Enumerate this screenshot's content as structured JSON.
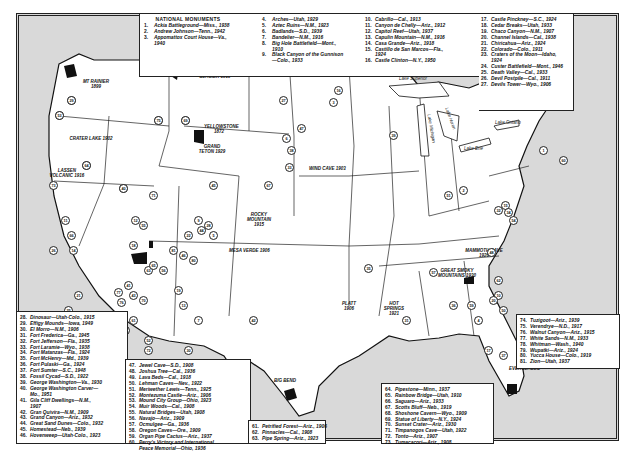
{
  "legend_top": {
    "title": "NATIONAL MONUMENTS",
    "col1": [
      {
        "n": "1.",
        "t": "Ackia Battleground—Miss., 1938"
      },
      {
        "n": "2.",
        "t": "Andrew Johnson—Tenn., 1942"
      },
      {
        "n": "3.",
        "t": "Appomattox Court House—Va.,"
      },
      {
        "n": "",
        "t": "1940"
      }
    ],
    "col2": [
      {
        "n": "4.",
        "t": "Arches—Utah, 1929"
      },
      {
        "n": "5.",
        "t": "Aztec Ruins—N.M., 1923"
      },
      {
        "n": "6.",
        "t": "Badlands—S.D., 1939"
      },
      {
        "n": "7.",
        "t": "Bandelier—N.M., 1916"
      },
      {
        "n": "8.",
        "t": "Big Hole Battlefield—Mont.,"
      },
      {
        "n": "",
        "t": "1910"
      },
      {
        "n": "9.",
        "t": "Black Canyon of the Gunnison"
      },
      {
        "n": "",
        "t": "—Colo., 1933"
      }
    ],
    "col3": [
      {
        "n": "10.",
        "t": "Cabrillo—Cal., 1913"
      },
      {
        "n": "11.",
        "t": "Canyon de Chelly—Ariz., 1912"
      },
      {
        "n": "12.",
        "t": "Capitol Reef—Utah, 1937"
      },
      {
        "n": "13.",
        "t": "Capulin Mountain—N.M., 1916"
      },
      {
        "n": "14.",
        "t": "Casa Grande—Ariz., 1918"
      },
      {
        "n": "15.",
        "t": "Castillo de San Marcos—Fla.,"
      },
      {
        "n": "",
        "t": "1924"
      },
      {
        "n": "16.",
        "t": "Castle Clinton—N.Y., 1950"
      }
    ],
    "col4": [
      {
        "n": "17.",
        "t": "Castle Pinckney—S.C., 1924"
      },
      {
        "n": "18.",
        "t": "Cedar Breaks—Utah, 1933"
      },
      {
        "n": "19.",
        "t": "Chaco Canyon—N.M., 1907"
      },
      {
        "n": "20.",
        "t": "Channel Islands—Cal., 1938"
      },
      {
        "n": "21.",
        "t": "Chiricahua—Ariz., 1924"
      },
      {
        "n": "22.",
        "t": "Colorado—Colo., 1911"
      },
      {
        "n": "23.",
        "t": "Craters of the Moon—Idaho,"
      },
      {
        "n": "",
        "t": "1924"
      },
      {
        "n": "24.",
        "t": "Custer Battlefield—Mont., 1946"
      },
      {
        "n": "25.",
        "t": "Death Valley—Cal., 1933"
      },
      {
        "n": "26.",
        "t": "Devil Postpile—Cal., 1911"
      },
      {
        "n": "27.",
        "t": "Devils Tower—Wyo., 1906"
      }
    ]
  },
  "legend_bl": [
    {
      "n": "28.",
      "t": "Dinosaur—Utah-Colo., 1915"
    },
    {
      "n": "29.",
      "t": "Effigy Mounds—Iowa, 1949"
    },
    {
      "n": "30.",
      "t": "El Morro—N.M., 1906"
    },
    {
      "n": "31.",
      "t": "Fort Frederica—Ga., 1945"
    },
    {
      "n": "32.",
      "t": "Fort Jefferson—Fla., 1935"
    },
    {
      "n": "33.",
      "t": "Fort Laramie—Wyo., 1938"
    },
    {
      "n": "34.",
      "t": "Fort Matanzas—Fla., 1924"
    },
    {
      "n": "35.",
      "t": "Fort McHenry—Md., 1939"
    },
    {
      "n": "36.",
      "t": "Fort Pulaski—Ga., 1924"
    },
    {
      "n": "37.",
      "t": "Fort Sumter—S.C., 1948"
    },
    {
      "n": "38.",
      "t": "Fossil Cycad—S.D., 1922"
    },
    {
      "n": "39.",
      "t": "George Washington—Va., 1930"
    },
    {
      "n": "40.",
      "t": "George Washington Carver—"
    },
    {
      "n": "",
      "t": "Mo., 1951"
    },
    {
      "n": "41.",
      "t": "Gila Cliff Dwellings—N.M.,"
    },
    {
      "n": "",
      "t": "1907"
    },
    {
      "n": "42.",
      "t": "Gran Quivira—N.M., 1909"
    },
    {
      "n": "43.",
      "t": "Grand Canyon—Ariz., 1932"
    },
    {
      "n": "44.",
      "t": "Great Sand Dunes—Colo., 1932"
    },
    {
      "n": "45.",
      "t": "Homestead—Neb., 1939"
    },
    {
      "n": "46.",
      "t": "Hovenweep—Utah-Colo., 1923"
    }
  ],
  "legend_bm": [
    {
      "n": "47.",
      "t": "Jewel Cave—S.D., 1908"
    },
    {
      "n": "48.",
      "t": "Joshua Tree—Cal., 1936"
    },
    {
      "n": "49.",
      "t": "Lava Beds—Cal., 1918"
    },
    {
      "n": "50.",
      "t": "Lehman Caves—Nev., 1922"
    },
    {
      "n": "51.",
      "t": "Meriwether Lewis—Tenn., 1925"
    },
    {
      "n": "52.",
      "t": "Montezuma Castle—Ariz., 1906"
    },
    {
      "n": "53.",
      "t": "Mound City Group—Ohio, 1923"
    },
    {
      "n": "54.",
      "t": "Muir Woods—Cal., 1908"
    },
    {
      "n": "55.",
      "t": "Natural Bridges—Utah, 1908"
    },
    {
      "n": "56.",
      "t": "Navajo—Ariz., 1909"
    },
    {
      "n": "57.",
      "t": "Ocmulgee—Ga., 1936"
    },
    {
      "n": "58.",
      "t": "Oregon Caves—Ore., 1909"
    },
    {
      "n": "59.",
      "t": "Organ Pipe Cactus—Ariz., 1937"
    },
    {
      "n": "60.",
      "t": "Perry's Victory and International"
    },
    {
      "n": "",
      "t": "Peace Memorial—Ohio, 1936"
    }
  ],
  "legend_bc": [
    {
      "n": "61.",
      "t": "Petrified Forest—Ariz., 1906"
    },
    {
      "n": "62.",
      "t": "Pinnacles—Cal., 1908"
    },
    {
      "n": "63.",
      "t": "Pipe Spring—Ariz., 1923"
    }
  ],
  "legend_br": [
    {
      "n": "64.",
      "t": "Pipestone—Minn., 1937"
    },
    {
      "n": "65.",
      "t": "Rainbow Bridge—Utah, 1910"
    },
    {
      "n": "66.",
      "t": "Saguaro—Ariz., 1933"
    },
    {
      "n": "67.",
      "t": "Scotts Bluff—Neb., 1919"
    },
    {
      "n": "68.",
      "t": "Shoshone Cavern—Wyo., 1909"
    },
    {
      "n": "69.",
      "t": "Statue of Liberty—N.Y., 1924"
    },
    {
      "n": "70.",
      "t": "Sunset Crater—Ariz., 1930"
    },
    {
      "n": "71.",
      "t": "Timpanogos Cave—Utah, 1922"
    },
    {
      "n": "72.",
      "t": "Tonto—Ariz., 1907"
    },
    {
      "n": "73.",
      "t": "Tumacacori—Ariz., 1908"
    }
  ],
  "legend_r": [
    {
      "n": "74.",
      "t": "Tuzigoot—Ariz., 1939"
    },
    {
      "n": "75.",
      "t": "Verendrye—N.D., 1917"
    },
    {
      "n": "76.",
      "t": "Walnut Canyon—Ariz., 1915"
    },
    {
      "n": "77.",
      "t": "White Sands—N.M., 1933"
    },
    {
      "n": "78.",
      "t": "Whitman—Wash., 1940"
    },
    {
      "n": "79.",
      "t": "Wupatki—Ariz., 1924"
    },
    {
      "n": "80.",
      "t": "Yucca House—Colo., 1919"
    },
    {
      "n": "81.",
      "t": "Zion—Utah, 1937"
    }
  ],
  "park_labels": {
    "glacier": "GLACIER 1910",
    "yellowstone": "YELLOWSTONE 1872",
    "grand_teton": "GRAND TETON 1929",
    "mt_rainier": "MT RAINIER 1899",
    "olympic": "OLYMPIC 1938",
    "crater_lake": "CRATER LAKE 1902",
    "lassen": "LASSEN VOLCANIC 1916",
    "wind_cave": "WIND CAVE 1903",
    "rocky_mountain": "ROCKY MOUNTAIN 1915",
    "mesa_verde": "MESA VERDE 1906",
    "platt": "PLATT 1906",
    "hot_springs": "HOT SPRINGS 1921",
    "mammoth_cave": "MAMMOTH CAVE 1926",
    "great_smoky": "GREAT SMOKY MOUNTAINS 1930",
    "big_bend": "BIG BEND",
    "acadia": "ACADIA 1929",
    "shenandoah": "SHENANDOAH",
    "everglades": "EVERGLADES"
  },
  "water_labels": [
    "Lake Superior",
    "Lake Michigan",
    "Lake Huron",
    "Lake Erie",
    "Lake Ontario"
  ],
  "map_markers": [
    "78",
    "58",
    "49",
    "23",
    "8",
    "24",
    "27",
    "47",
    "6",
    "38",
    "33",
    "67",
    "45",
    "71",
    "55",
    "12",
    "18",
    "81",
    "63",
    "65",
    "56",
    "46",
    "80",
    "9",
    "22",
    "44",
    "28",
    "5",
    "19",
    "13",
    "7",
    "30",
    "42",
    "41",
    "77",
    "43",
    "70",
    "76",
    "61",
    "74",
    "52",
    "79",
    "72",
    "14",
    "11",
    "66",
    "73",
    "21",
    "25",
    "26",
    "54",
    "62",
    "48",
    "10",
    "20",
    "50",
    "4",
    "59",
    "17",
    "37",
    "31",
    "36",
    "57",
    "15",
    "34",
    "32",
    "1",
    "2",
    "51",
    "39",
    "3",
    "35",
    "16",
    "60",
    "53",
    "29",
    "64",
    "40",
    "75",
    "69"
  ]
}
